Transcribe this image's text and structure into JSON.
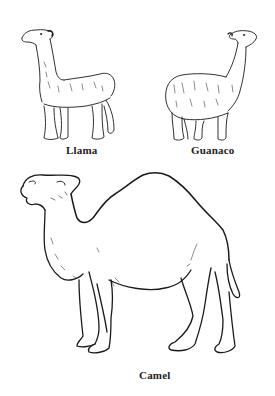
{
  "figure": {
    "background": "#ffffff",
    "line_color": "#1a1a1a",
    "animals": [
      {
        "id": "llama",
        "label": "Llama"
      },
      {
        "id": "guanaco",
        "label": "Guanaco"
      },
      {
        "id": "camel",
        "label": "Camel"
      }
    ]
  }
}
